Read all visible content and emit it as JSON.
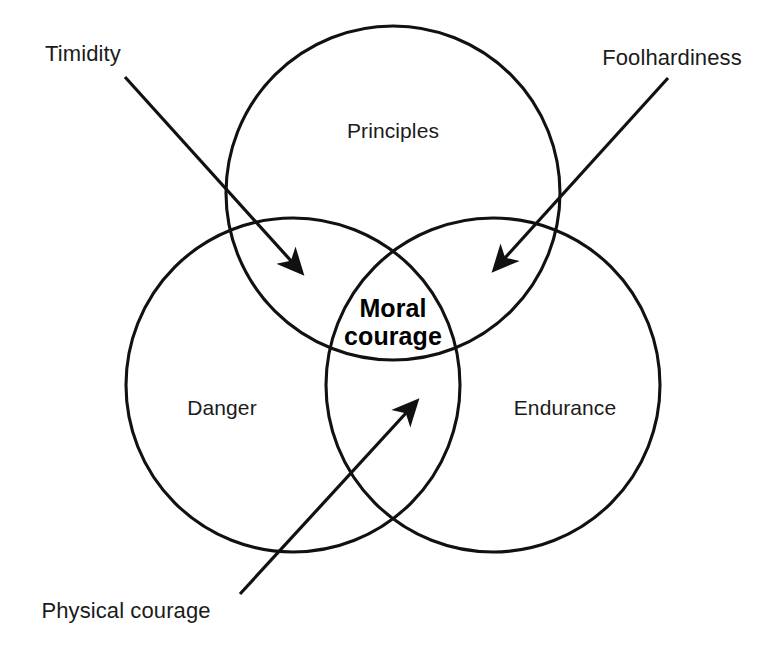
{
  "diagram": {
    "type": "venn-3-circle",
    "title_text": "",
    "background_color": "#ffffff",
    "stroke_color": "#111111",
    "text_color": "#1b1b1b",
    "center_text_color": "#000000",
    "circles": [
      {
        "id": "principles",
        "label": "Principles",
        "cx": 393,
        "cy": 193,
        "r": 167
      },
      {
        "id": "danger",
        "label": "Danger",
        "cx": 293,
        "cy": 385,
        "r": 167
      },
      {
        "id": "endurance",
        "label": "Endurance",
        "cx": 493,
        "cy": 385,
        "r": 167
      }
    ],
    "set_labels": [
      {
        "id": "principles-label",
        "text": "Principles",
        "x": 393,
        "y": 131
      },
      {
        "id": "danger-label",
        "text": "Danger",
        "x": 222,
        "y": 408
      },
      {
        "id": "endurance-label",
        "text": "Endurance",
        "x": 565,
        "y": 408
      }
    ],
    "center_label": {
      "id": "moral-courage-label",
      "line1": "Moral",
      "line2": "courage",
      "x": 393,
      "y": 322
    },
    "callouts": [
      {
        "id": "timidity",
        "text": "Timidity",
        "label_x": 83,
        "label_y": 54,
        "arrow_start_x": 125,
        "arrow_start_y": 77,
        "arrow_end_x": 302,
        "arrow_end_y": 273,
        "target_region": "principles-danger-overlap"
      },
      {
        "id": "foolhardiness",
        "text": "Foolhardiness",
        "label_x": 672,
        "label_y": 58,
        "arrow_start_x": 668,
        "arrow_start_y": 78,
        "arrow_end_x": 494,
        "arrow_end_y": 270,
        "target_region": "principles-endurance-overlap"
      },
      {
        "id": "physical-courage",
        "text": "Physical courage",
        "label_x": 126,
        "label_y": 611,
        "arrow_start_x": 240,
        "arrow_start_y": 594,
        "arrow_end_x": 417,
        "arrow_end_y": 401,
        "target_region": "danger-endurance-overlap"
      }
    ]
  }
}
